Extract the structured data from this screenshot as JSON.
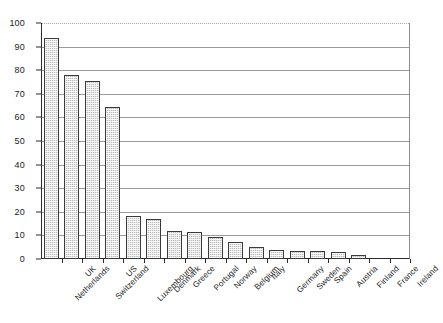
{
  "chart_data": {
    "type": "bar",
    "title": "",
    "subtitle": "",
    "xlabel": "",
    "ylabel": "",
    "ylim": [
      0,
      100
    ],
    "yticks": [
      0,
      10,
      20,
      30,
      40,
      50,
      60,
      70,
      80,
      90,
      100
    ],
    "grid": true,
    "legend": "none",
    "orientation": "vertical",
    "bar_color": "#bdbdbd",
    "bar_edge_color": "#3a3a3a",
    "categories": [
      "Netherlands",
      "UK",
      "Switzerland",
      "US",
      "Luxembourg",
      "Denmark",
      "Greece",
      "Portugal",
      "Norway",
      "Belgium",
      "Italy",
      "Germany",
      "Sweden",
      "Spain",
      "Austria",
      "Finland",
      "France",
      "Ireland"
    ],
    "values": [
      93.5,
      77.8,
      75.3,
      64.5,
      18.3,
      17.0,
      12.0,
      11.3,
      9.2,
      7.0,
      5.0,
      4.0,
      3.6,
      3.3,
      3.1,
      1.6,
      0,
      0
    ]
  }
}
